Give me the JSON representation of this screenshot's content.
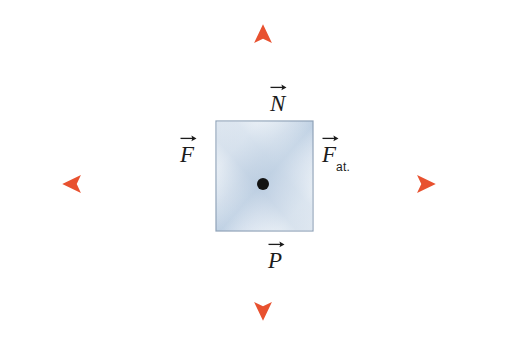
{
  "figure": {
    "background_color": "#ffffff"
  },
  "colors": {
    "vector": "#e8512f",
    "vector_light": "#f0a07a",
    "ground_line": "#4a4a4a",
    "block_border": "#8fa2b8",
    "block_fill_light": "#ffffff",
    "block_shade": "#cdd9e8",
    "center_dot": "#131313",
    "label_text": "#1c1c1c"
  },
  "ground": {
    "name": "ground-line",
    "x1": 12,
    "x2": 512,
    "y": 231
  },
  "block": {
    "name": "block",
    "x": 216,
    "y": 121,
    "width": 97,
    "height": 110
  },
  "origin": {
    "name": "center-point",
    "x": 263,
    "y": 184,
    "radius": 6
  },
  "vectors": [
    {
      "id": "N",
      "name": "normal-force-vector",
      "label": "N",
      "subscript": "",
      "direction": "up",
      "x1": 263,
      "y1": 184,
      "x2": 263,
      "y2": 25,
      "label_x": 270,
      "label_y": 92
    },
    {
      "id": "P",
      "name": "weight-force-vector",
      "label": "P",
      "subscript": "",
      "direction": "down",
      "x1": 263,
      "y1": 184,
      "x2": 263,
      "y2": 320,
      "label_x": 268,
      "label_y": 249
    },
    {
      "id": "F",
      "name": "applied-force-vector",
      "label": "F",
      "subscript": "",
      "direction": "left",
      "x1": 263,
      "y1": 184,
      "x2": 63,
      "y2": 184,
      "label_x": 180,
      "label_y": 143
    },
    {
      "id": "Fat",
      "name": "friction-force-vector",
      "label": "F",
      "subscript": "at.",
      "direction": "right",
      "x1": 263,
      "y1": 184,
      "x2": 435,
      "y2": 184,
      "label_x": 322,
      "label_y": 143
    }
  ],
  "axes": {
    "vertical_line": {
      "name": "vertical-axis",
      "x": 263,
      "y1": 25,
      "y2": 320
    },
    "horizontal_line": {
      "name": "horizontal-axis",
      "y": 184,
      "x1": 63,
      "x2": 435
    }
  }
}
